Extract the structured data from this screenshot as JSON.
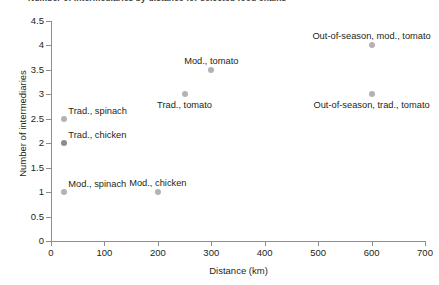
{
  "title_partial": "Number of intermediaries by distance for selected food chains",
  "chart_data": {
    "type": "scatter",
    "title": "",
    "xlabel": "Distance (km)",
    "ylabel": "Number of intermediaries",
    "xlim": [
      0,
      700
    ],
    "ylim": [
      0,
      4.5
    ],
    "xticks": [
      "0",
      "100",
      "200",
      "300",
      "400",
      "500",
      "600",
      "700"
    ],
    "xtick_values": [
      0,
      100,
      200,
      300,
      400,
      500,
      600,
      700
    ],
    "yticks": [
      "0",
      "0.5",
      "1",
      "1.5",
      "2",
      "2.5",
      "3",
      "3.5",
      "4",
      "4.5"
    ],
    "ytick_values": [
      0,
      0.5,
      1,
      1.5,
      2,
      2.5,
      3,
      3.5,
      4,
      4.5
    ],
    "grid": false,
    "legend": "none",
    "marker_color": "#b3b3b3",
    "marker_color_dark": "#8c8c8c",
    "axis_color": "#8e8e8e",
    "points": [
      {
        "label": "Trad., spinach",
        "x": 25,
        "y": 2.5,
        "color": "#b3b3b3",
        "label_pos": "above-right"
      },
      {
        "label": "Trad., chicken",
        "x": 25,
        "y": 2.0,
        "color": "#8c8c8c",
        "label_pos": "above-right"
      },
      {
        "label": "Mod., spinach",
        "x": 25,
        "y": 1.0,
        "color": "#b3b3b3",
        "label_pos": "above-right"
      },
      {
        "label": "Mod., chicken",
        "x": 200,
        "y": 1.0,
        "color": "#b3b3b3",
        "label_pos": "above-center"
      },
      {
        "label": "Trad., tomato",
        "x": 250,
        "y": 3.0,
        "color": "#b3b3b3",
        "label_pos": "below-center"
      },
      {
        "label": "Mod., tomato",
        "x": 300,
        "y": 3.5,
        "color": "#b3b3b3",
        "label_pos": "above-center"
      },
      {
        "label": "Out-of-season, trad., tomato",
        "x": 600,
        "y": 3.0,
        "color": "#b3b3b3",
        "label_pos": "below-center"
      },
      {
        "label": "Out-of-season, mod., tomato",
        "x": 600,
        "y": 4.0,
        "color": "#b3b3b3",
        "label_pos": "above-center"
      }
    ]
  }
}
